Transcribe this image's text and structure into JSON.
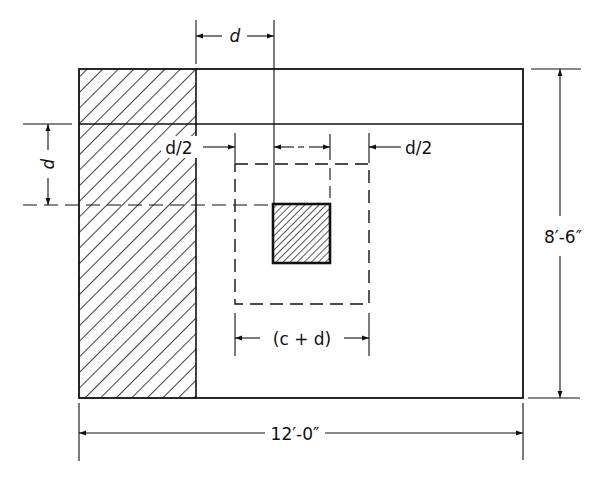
{
  "diagram": {
    "colors": {
      "line": "#111111",
      "background": "#ffffff",
      "hatch": "#111111"
    },
    "labels": {
      "top_d": "d",
      "left_d": "d",
      "left_half_d": "d/2",
      "right_half_d": "d/2",
      "c_plus_d": "(c + d)",
      "height": "8′-6″",
      "width": "12′-0″"
    },
    "elements": {
      "footing": "footing-outline",
      "hatched_strip": "critical-section-strip",
      "column": "column",
      "punching_perimeter": "dashed-punching-shear-perimeter"
    }
  }
}
